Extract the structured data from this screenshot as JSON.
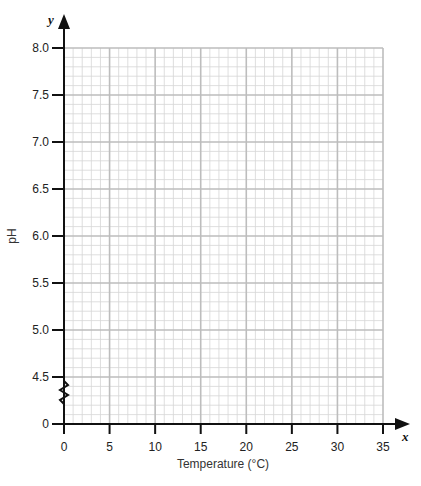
{
  "chart_data": {
    "type": "line",
    "title": "",
    "xlabel": "Temperature (°C)",
    "ylabel": "pH",
    "x_axis_var": "x",
    "y_axis_var": "y",
    "xlim": [
      0,
      35
    ],
    "ylim": [
      4.5,
      8.0
    ],
    "y_axis_break": {
      "from": 0,
      "to": 4.5,
      "symbol": "zigzag"
    },
    "x_ticks": [
      0,
      5,
      10,
      15,
      20,
      25,
      30,
      35
    ],
    "x_tick_labels": [
      "0",
      "5",
      "10",
      "15",
      "20",
      "25",
      "30",
      "35"
    ],
    "y_ticks": [
      0,
      4.5,
      5.0,
      5.5,
      6.0,
      6.5,
      7.0,
      7.5,
      8.0
    ],
    "y_tick_labels": [
      "0",
      "4.5",
      "5.0",
      "5.5",
      "6.0",
      "6.5",
      "7.0",
      "7.5",
      "8.0"
    ],
    "grid": {
      "on": true,
      "minor_x_step": 1,
      "minor_y_step": 0.1,
      "major_x_step": 5,
      "major_y_step": 0.5
    },
    "series": [],
    "legend": null
  },
  "colors": {
    "axis": "#111111",
    "minor_grid": "#d6d6d6",
    "major_grid": "#bdbdbd",
    "background": "#ffffff"
  }
}
